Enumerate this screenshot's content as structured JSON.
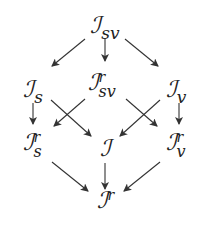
{
  "diagram": {
    "type": "commutative-lattice",
    "nodes": {
      "I_sv": {
        "base": "ℐ",
        "sub": "sv",
        "sup": ""
      },
      "I_s": {
        "base": "ℐ",
        "sub": "s",
        "sup": ""
      },
      "I_sv_r": {
        "base": "ℐ",
        "sub": "sv",
        "sup": "r"
      },
      "I_v": {
        "base": "ℐ",
        "sub": "v",
        "sup": ""
      },
      "I_s_r": {
        "base": "ℐ",
        "sub": "s",
        "sup": "r"
      },
      "I": {
        "base": "ℐ",
        "sub": "",
        "sup": ""
      },
      "I_v_r": {
        "base": "ℐ",
        "sub": "v",
        "sup": "r"
      },
      "I_r": {
        "base": "ℐ",
        "sub": "",
        "sup": "r"
      }
    },
    "edges": [
      {
        "from": "I_sv",
        "to": "I_s"
      },
      {
        "from": "I_sv",
        "to": "I_sv_r"
      },
      {
        "from": "I_sv",
        "to": "I_v"
      },
      {
        "from": "I_s",
        "to": "I_s_r"
      },
      {
        "from": "I_s",
        "to": "I"
      },
      {
        "from": "I_sv_r",
        "to": "I_s_r"
      },
      {
        "from": "I_sv_r",
        "to": "I_v_r"
      },
      {
        "from": "I_v",
        "to": "I"
      },
      {
        "from": "I_v",
        "to": "I_v_r"
      },
      {
        "from": "I_s_r",
        "to": "I_r"
      },
      {
        "from": "I",
        "to": "I_r"
      },
      {
        "from": "I_v_r",
        "to": "I_r"
      }
    ],
    "colors": {
      "stroke": "#333333",
      "text": "#222222",
      "background": "#ffffff"
    }
  }
}
